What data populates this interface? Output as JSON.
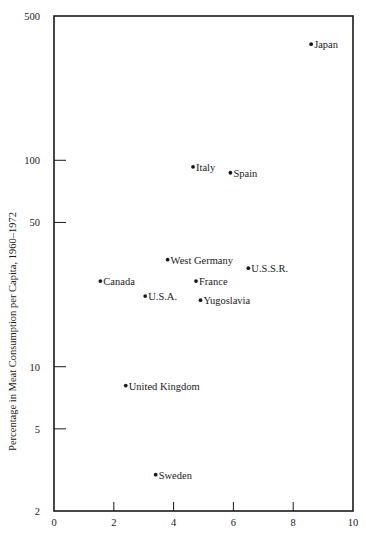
{
  "chart_data": {
    "type": "scatter",
    "title": "",
    "xlabel": "",
    "ylabel": "Percentage in Meat Consumption per Capita, 1960–1972",
    "xlim": [
      0,
      10
    ],
    "ylim": [
      2,
      500
    ],
    "yscale": "log",
    "grid": false,
    "legend": null,
    "x_ticks": [
      0,
      2,
      4,
      6,
      8,
      10
    ],
    "y_ticks": [
      2,
      5,
      10,
      50,
      100,
      500
    ],
    "points": [
      {
        "label": "Japan",
        "x": 8.6,
        "y": 365
      },
      {
        "label": "Italy",
        "x": 4.65,
        "y": 93
      },
      {
        "label": "Spain",
        "x": 5.9,
        "y": 87
      },
      {
        "label": "West Germany",
        "x": 3.8,
        "y": 33
      },
      {
        "label": "U.S.S.R.",
        "x": 6.5,
        "y": 30
      },
      {
        "label": "Canada",
        "x": 1.55,
        "y": 26
      },
      {
        "label": "France",
        "x": 4.75,
        "y": 26
      },
      {
        "label": "U.S.A.",
        "x": 3.05,
        "y": 22
      },
      {
        "label": "Yugoslavia",
        "x": 4.9,
        "y": 21
      },
      {
        "label": "United Kingdom",
        "x": 2.4,
        "y": 8.1
      },
      {
        "label": "Sweden",
        "x": 3.4,
        "y": 3.0
      }
    ]
  },
  "colors": {
    "ink": "#1a1a1a",
    "background": "#ffffff"
  }
}
